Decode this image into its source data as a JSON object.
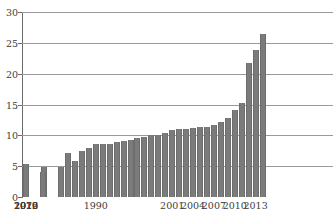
{
  "title": {
    "text": "",
    "visible_fragment": "(clipped title row, illegible)"
  },
  "chart_data": {
    "type": "bar",
    "title": "",
    "subtitle": "",
    "xlabel": "",
    "ylabel": "",
    "grid": true,
    "legend": null,
    "bar_color": "#7b7b7b",
    "grid_color": "#9a9a9a",
    "axis_color": "#6a6a6a",
    "ylim": [
      0,
      30
    ],
    "ytick_values": [
      0,
      5,
      10,
      15,
      20,
      25,
      30
    ],
    "ytick_labels": [
      "0",
      "5",
      "10",
      "15",
      "20",
      "25",
      "30"
    ],
    "xtick_labels": [
      "1970",
      "1990",
      "2001",
      "2004",
      "2007",
      "2010",
      "2013",
      "2016",
      "2019",
      "2022"
    ],
    "xtick_categories": [
      "1970",
      "1990",
      "2001",
      "2004",
      "2007",
      "2010",
      "2013",
      "2016",
      "2019",
      "2022"
    ],
    "categories": [
      "1970",
      "1975",
      "1980",
      "1985",
      "1986",
      "1987",
      "1988",
      "1989",
      "1990",
      "1991",
      "1992",
      "1993",
      "1994",
      "1995",
      "1996",
      "1997",
      "1998",
      "1999",
      "2000",
      "2001",
      "2002",
      "2003",
      "2004",
      "2005",
      "2006",
      "2007",
      "2008",
      "2009",
      "2010",
      "2011",
      "2012",
      "2013",
      "2014",
      "2015",
      "2016",
      "2017",
      "2018",
      "2019",
      "2020",
      "2021",
      "2022",
      "2023"
    ],
    "values": [
      5.4,
      4.8,
      4.0,
      4.8,
      7.1,
      5.8,
      7.4,
      8.0,
      8.6,
      8.6,
      8.6,
      9.0,
      9.1,
      9.3,
      9.5,
      9.8,
      10.0,
      10.1,
      10.3,
      10.9,
      11.0,
      11.1,
      11.2,
      11.4,
      11.4,
      11.7,
      12.2,
      12.8,
      14.1,
      15.2,
      21.7,
      23.8,
      26.4,
      0,
      0,
      0,
      0,
      0,
      0,
      0,
      0,
      0
    ],
    "bars": [
      {
        "label": "1970",
        "value": 5.4
      },
      {
        "label": "1975",
        "value": 4.8
      },
      {
        "label": "1980",
        "value": 4.0
      },
      {
        "label": "1985",
        "value": 4.8
      },
      {
        "label": "1986",
        "value": 7.1
      },
      {
        "label": "1987",
        "value": 5.8
      },
      {
        "label": "1988",
        "value": 7.4
      },
      {
        "label": "1989",
        "value": 8.0
      },
      {
        "label": "1990",
        "value": 8.6
      },
      {
        "label": "1991",
        "value": 8.6
      },
      {
        "label": "1992",
        "value": 8.6
      },
      {
        "label": "1993",
        "value": 9.0
      },
      {
        "label": "1994",
        "value": 9.1
      },
      {
        "label": "1995",
        "value": 9.3
      },
      {
        "label": "1996",
        "value": 9.5
      },
      {
        "label": "1997",
        "value": 9.8
      },
      {
        "label": "1998",
        "value": 10.0
      },
      {
        "label": "1999",
        "value": 10.1
      },
      {
        "label": "2000",
        "value": 10.3
      },
      {
        "label": "2001",
        "value": 10.9
      },
      {
        "label": "2002",
        "value": 11.0
      },
      {
        "label": "2003",
        "value": 11.1
      },
      {
        "label": "2004",
        "value": 11.2
      },
      {
        "label": "2005",
        "value": 11.4
      },
      {
        "label": "2006",
        "value": 11.4
      },
      {
        "label": "2007",
        "value": 11.7
      },
      {
        "label": "2008",
        "value": 12.2
      },
      {
        "label": "2009",
        "value": 12.8
      },
      {
        "label": "2010",
        "value": 14.1
      },
      {
        "label": "2011",
        "value": 15.2
      },
      {
        "label": "2012",
        "value": 21.7
      },
      {
        "label": "2013",
        "value": 23.8
      },
      {
        "label": "2014",
        "value": 26.4
      }
    ]
  }
}
